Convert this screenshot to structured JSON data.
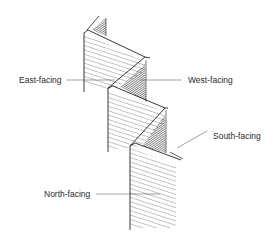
{
  "diagram": {
    "type": "zigzag-wall-orientation",
    "labels": {
      "east": "East-facing",
      "west": "West-facing",
      "south": "South-facing",
      "north": "North-facing"
    },
    "colors": {
      "ink": "#222222",
      "background": "#ffffff",
      "label_text": "#2a2a2a"
    }
  }
}
